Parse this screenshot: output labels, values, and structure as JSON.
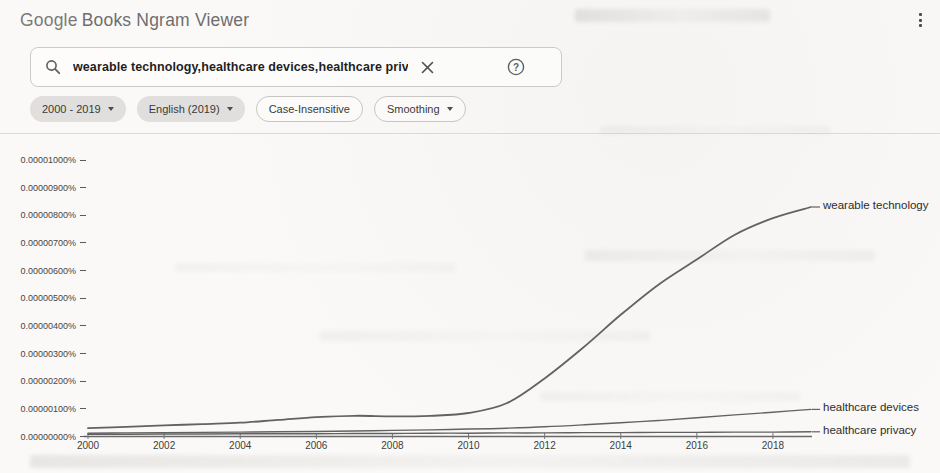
{
  "header": {
    "brand": "Google",
    "product": "Books Ngram Viewer"
  },
  "menu": {
    "more_options_icon": "kebab-menu"
  },
  "search": {
    "query": "wearable technology,healthcare devices,healthcare privacy",
    "search_icon": "magnifier",
    "clear_icon": "x-mark",
    "help_icon": "question-circle",
    "help_glyph": "?"
  },
  "filters": {
    "year_range": "2000 - 2019",
    "corpus": "English (2019)",
    "case_sensitivity": "Case-Insensitive",
    "smoothing": "Smoothing"
  },
  "chart_data": {
    "type": "line",
    "title": "",
    "xlabel": "",
    "ylabel": "",
    "grid": false,
    "legend_position": "line-end-labels-right",
    "line_color": "#626262",
    "xlim": [
      2000,
      2019
    ],
    "ylim": [
      0,
      1e-05
    ],
    "x": [
      2000,
      2001,
      2002,
      2003,
      2004,
      2005,
      2006,
      2007,
      2008,
      2009,
      2010,
      2011,
      2012,
      2013,
      2014,
      2015,
      2016,
      2017,
      2018,
      2019
    ],
    "xticks": [
      "2000",
      "2002",
      "2004",
      "2006",
      "2008",
      "2010",
      "2012",
      "2014",
      "2016",
      "2018"
    ],
    "yticks": [
      "0.00001000%",
      "0.00000900%",
      "0.00000800%",
      "0.00000700%",
      "0.00000600%",
      "0.00000500%",
      "0.00000400%",
      "0.00000300%",
      "0.00000200%",
      "0.00000100%",
      "0.00000000%"
    ],
    "series": [
      {
        "name": "wearable technology",
        "values": [
          3e-07,
          3.5e-07,
          4e-07,
          4.5e-07,
          5e-07,
          6e-07,
          7e-07,
          7.5e-07,
          7.3e-07,
          7.5e-07,
          8.5e-07,
          1.2e-06,
          2.1e-06,
          3.2e-06,
          4.4e-06,
          5.5e-06,
          6.4e-06,
          7.3e-06,
          7.9e-06,
          8.3e-06
        ]
      },
      {
        "name": "healthcare devices",
        "values": [
          1.2e-07,
          1.3e-07,
          1.4e-07,
          1.5e-07,
          1.6e-07,
          1.7e-07,
          1.8e-07,
          2e-07,
          2.2e-07,
          2.4e-07,
          2.7e-07,
          3e-07,
          3.5e-07,
          4.2e-07,
          5e-07,
          5.8e-07,
          6.8e-07,
          7.8e-07,
          8.8e-07,
          9.8e-07
        ]
      },
      {
        "name": "healthcare privacy",
        "values": [
          8e-08,
          8e-08,
          9e-08,
          9e-08,
          1e-07,
          1e-07,
          1e-07,
          1.1e-07,
          1.1e-07,
          1.2e-07,
          1.2e-07,
          1.3e-07,
          1.3e-07,
          1.4e-07,
          1.4e-07,
          1.5e-07,
          1.5e-07,
          1.6e-07,
          1.6e-07,
          1.7e-07
        ]
      }
    ]
  }
}
